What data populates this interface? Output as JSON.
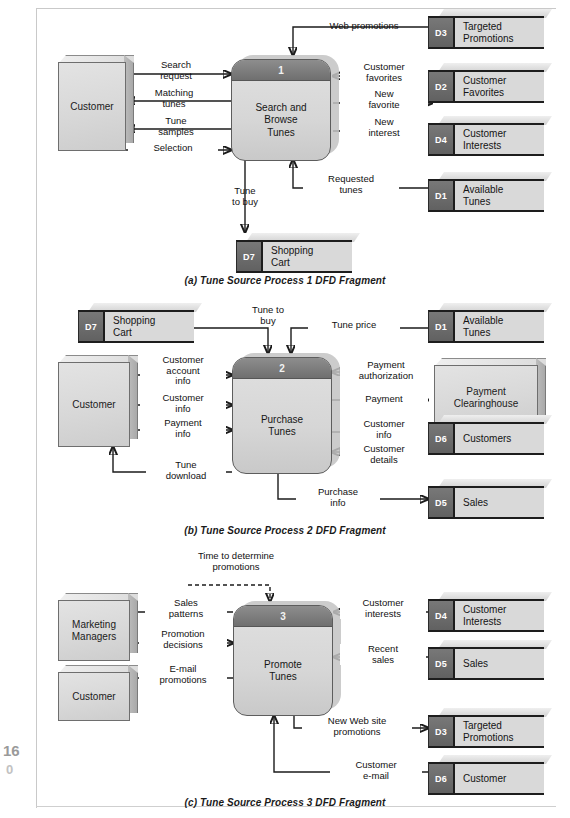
{
  "page": {
    "folio_top": "16",
    "folio_bottom": "0"
  },
  "figure": {
    "captions": {
      "a": "(a) Tune Source Process 1 DFD Fragment",
      "b": "(b) Tune Source Process 2 DFD Fragment",
      "c": "(c) Tune Source Process 3 DFD Fragment"
    }
  },
  "fragment_a": {
    "entities": [
      {
        "id": "customer",
        "label": "Customer"
      }
    ],
    "process": {
      "number": "1",
      "name": "Search and\nBrowse\nTunes"
    },
    "stores": [
      {
        "id": "D3",
        "tag": "D3",
        "name": "Targeted\nPromotions"
      },
      {
        "id": "D2",
        "tag": "D2",
        "name": "Customer\nFavorites"
      },
      {
        "id": "D4",
        "tag": "D4",
        "name": "Customer\nInterests"
      },
      {
        "id": "D1",
        "tag": "D1",
        "name": "Available\nTunes"
      },
      {
        "id": "D7",
        "tag": "D7",
        "name": "Shopping\nCart"
      }
    ],
    "flows": [
      {
        "id": "web-promotions",
        "label": "Web promotions",
        "from": "D3",
        "to": "process-1"
      },
      {
        "id": "search-request",
        "label": "Search\nrequest",
        "from": "customer",
        "to": "process-1"
      },
      {
        "id": "matching-tunes",
        "label": "Matching\ntunes",
        "from": "process-1",
        "to": "customer"
      },
      {
        "id": "tune-samples",
        "label": "Tune\nsamples",
        "from": "process-1",
        "to": "customer"
      },
      {
        "id": "selection",
        "label": "Selection",
        "from": "customer",
        "to": "process-1"
      },
      {
        "id": "customer-favorites",
        "label": "Customer\nfavorites",
        "from": "D2",
        "to": "process-1"
      },
      {
        "id": "new-favorite",
        "label": "New\nfavorite",
        "from": "process-1",
        "to": "D2"
      },
      {
        "id": "new-interest",
        "label": "New\ninterest",
        "from": "process-1",
        "to": "D4"
      },
      {
        "id": "requested-tunes",
        "label": "Requested\ntunes",
        "from": "D1",
        "to": "process-1"
      },
      {
        "id": "tune-to-buy",
        "label": "Tune\nto buy",
        "from": "process-1",
        "to": "D7"
      }
    ]
  },
  "fragment_b": {
    "entities": [
      {
        "id": "customer",
        "label": "Customer"
      },
      {
        "id": "payment-clearinghouse",
        "label": "Payment\nClearinghouse"
      }
    ],
    "process": {
      "number": "2",
      "name": "Purchase\nTunes"
    },
    "stores": [
      {
        "id": "D7",
        "tag": "D7",
        "name": "Shopping\nCart"
      },
      {
        "id": "D1",
        "tag": "D1",
        "name": "Available\nTunes"
      },
      {
        "id": "D6",
        "tag": "D6",
        "name": "Customers"
      },
      {
        "id": "D5",
        "tag": "D5",
        "name": "Sales"
      }
    ],
    "flows": [
      {
        "id": "tune-to-buy",
        "label": "Tune to\nbuy",
        "from": "D7",
        "to": "process-2"
      },
      {
        "id": "tune-price",
        "label": "Tune price",
        "from": "D1",
        "to": "process-2"
      },
      {
        "id": "customer-account-info",
        "label": "Customer\naccount\ninfo",
        "from": "customer",
        "to": "process-2"
      },
      {
        "id": "customer-info-in",
        "label": "Customer\ninfo",
        "from": "customer",
        "to": "process-2"
      },
      {
        "id": "payment-info",
        "label": "Payment\ninfo",
        "from": "customer",
        "to": "process-2"
      },
      {
        "id": "tune-download",
        "label": "Tune\ndownload",
        "from": "process-2",
        "to": "customer"
      },
      {
        "id": "payment-authorization",
        "label": "Payment\nauthorization",
        "from": "payment-clearinghouse",
        "to": "process-2"
      },
      {
        "id": "payment",
        "label": "Payment",
        "from": "process-2",
        "to": "payment-clearinghouse"
      },
      {
        "id": "customer-info-out",
        "label": "Customer\ninfo",
        "from": "process-2",
        "to": "D6"
      },
      {
        "id": "customer-details",
        "label": "Customer\ndetails",
        "from": "D6",
        "to": "process-2"
      },
      {
        "id": "purchase-info",
        "label": "Purchase\ninfo",
        "from": "process-2",
        "to": "D5"
      }
    ]
  },
  "fragment_c": {
    "entities": [
      {
        "id": "marketing-managers",
        "label": "Marketing\nManagers"
      },
      {
        "id": "customer",
        "label": "Customer"
      }
    ],
    "process": {
      "number": "3",
      "name": "Promote\nTunes"
    },
    "stores": [
      {
        "id": "D4",
        "tag": "D4",
        "name": "Customer\nInterests"
      },
      {
        "id": "D5",
        "tag": "D5",
        "name": "Sales"
      },
      {
        "id": "D3",
        "tag": "D3",
        "name": "Targeted\nPromotions"
      },
      {
        "id": "D6",
        "tag": "D6",
        "name": "Customer"
      }
    ],
    "flows": [
      {
        "id": "time-to-determine-promotions",
        "label": "Time to determine\npromotions",
        "from": "temporal-trigger",
        "to": "process-3",
        "style": "dashed"
      },
      {
        "id": "sales-patterns",
        "label": "Sales\npatterns",
        "from": "process-3",
        "to": "marketing-managers"
      },
      {
        "id": "promotion-decisions",
        "label": "Promotion\ndecisions",
        "from": "marketing-managers",
        "to": "process-3"
      },
      {
        "id": "email-promotions",
        "label": "E-mail\npromotions",
        "from": "process-3",
        "to": "customer"
      },
      {
        "id": "customer-interests",
        "label": "Customer\ninterests",
        "from": "D4",
        "to": "process-3"
      },
      {
        "id": "recent-sales",
        "label": "Recent\nsales",
        "from": "D5",
        "to": "process-3"
      },
      {
        "id": "new-web-site-promotions",
        "label": "New Web site\npromotions",
        "from": "process-3",
        "to": "D3"
      },
      {
        "id": "customer-email",
        "label": "Customer\ne-mail",
        "from": "D6",
        "to": "process-3"
      }
    ]
  }
}
